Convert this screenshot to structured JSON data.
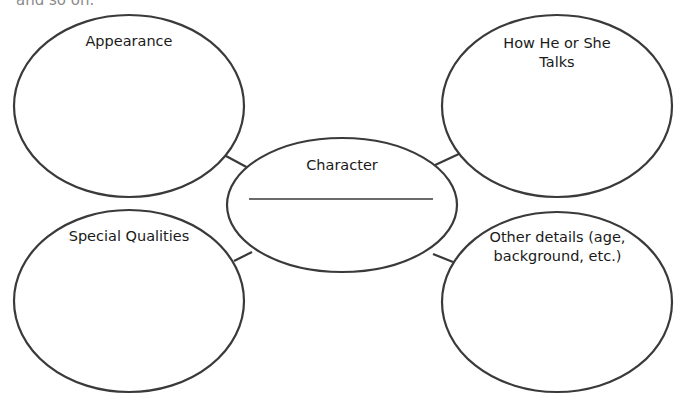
{
  "top_cutoff_text": "and so on.",
  "center": {
    "title": "Character",
    "blank_line": ""
  },
  "nodes": [
    {
      "id": "top-left",
      "label": "Appearance"
    },
    {
      "id": "top-right",
      "label": "How He or She Talks"
    },
    {
      "id": "bottom-left",
      "label": "Special Qualities"
    },
    {
      "id": "bottom-right",
      "label": "Other details (age, background, etc.)"
    }
  ],
  "colors": {
    "stroke": "#3a3a3a",
    "text": "#1a1a1a",
    "background": "#ffffff"
  }
}
